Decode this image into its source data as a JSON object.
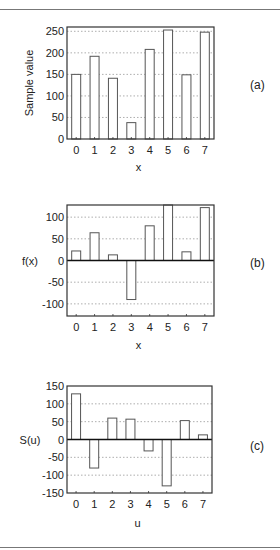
{
  "chart_data": [
    {
      "id": "a",
      "type": "bar",
      "panel_label": "(a)",
      "title": "",
      "xlabel": "x",
      "ylabel": "Sample value",
      "categories": [
        "0",
        "1",
        "2",
        "3",
        "4",
        "5",
        "6",
        "7"
      ],
      "values": [
        150,
        192,
        141,
        38,
        208,
        253,
        149,
        248
      ],
      "ylim": [
        0,
        260
      ],
      "yticks": [
        0,
        50,
        100,
        150,
        200,
        250
      ],
      "grid": true,
      "legend": null
    },
    {
      "id": "b",
      "type": "bar",
      "panel_label": "(b)",
      "title": "",
      "xlabel": "x",
      "ylabel": "f(x)",
      "categories": [
        "0",
        "1",
        "2",
        "3",
        "4",
        "5",
        "6",
        "7"
      ],
      "values": [
        22,
        64,
        13,
        -90,
        80,
        128,
        20,
        122
      ],
      "ylim": [
        -128,
        128
      ],
      "yticks": [
        -100,
        -50,
        0,
        50,
        100
      ],
      "grid": true,
      "legend": null
    },
    {
      "id": "c",
      "type": "bar",
      "panel_label": "(c)",
      "title": "",
      "xlabel": "u",
      "ylabel": "S(u)",
      "categories": [
        "0",
        "1",
        "2",
        "3",
        "4",
        "5",
        "6",
        "7"
      ],
      "values": [
        128,
        -80,
        60,
        57,
        -32,
        -130,
        53,
        13
      ],
      "ylim": [
        -150,
        150
      ],
      "yticks": [
        -150,
        -100,
        -50,
        0,
        50,
        100,
        150
      ],
      "grid": true,
      "legend": null
    }
  ]
}
